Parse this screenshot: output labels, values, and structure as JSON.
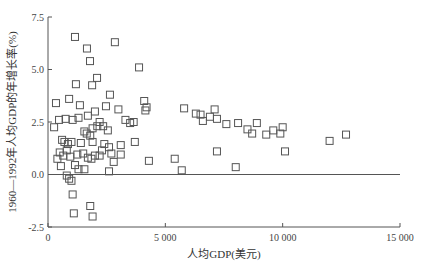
{
  "chart_data": {
    "type": "scatter",
    "title": "",
    "xlabel": "人均GDP(美元)",
    "ylabel": "1960—1992年人均GDP的年增长率(%)",
    "xlim": [
      0,
      15000
    ],
    "ylim": [
      -2.5,
      7.5
    ],
    "xticks": [
      0,
      5000,
      10000,
      15000
    ],
    "xtick_labels": [
      "0",
      "5 000",
      "10 000",
      "15 000"
    ],
    "yticks": [
      -2.5,
      0.0,
      2.5,
      5.0,
      7.5
    ],
    "ytick_labels": [
      "-2.5",
      "0.0",
      "2.5",
      "5.0",
      "7.5"
    ],
    "grid": false,
    "legend": null,
    "reference_line": {
      "y": 0.0
    },
    "marker": "open-square",
    "series": [
      {
        "name": "countries",
        "points": [
          [
            1150,
            6.55
          ],
          [
            1660,
            6.0
          ],
          [
            1790,
            5.4
          ],
          [
            2850,
            6.3
          ],
          [
            2090,
            4.6
          ],
          [
            1190,
            4.3
          ],
          [
            1880,
            4.25
          ],
          [
            2640,
            3.8
          ],
          [
            3880,
            5.1
          ],
          [
            340,
            3.4
          ],
          [
            900,
            3.6
          ],
          [
            1360,
            3.3
          ],
          [
            2470,
            3.25
          ],
          [
            470,
            2.6
          ],
          [
            260,
            2.25
          ],
          [
            3650,
            2.5
          ],
          [
            4100,
            3.5
          ],
          [
            4200,
            3.2
          ],
          [
            3000,
            3.1
          ],
          [
            2000,
            3.0
          ],
          [
            1300,
            2.7
          ],
          [
            1700,
            2.8
          ],
          [
            2200,
            2.5
          ],
          [
            2100,
            2.3
          ],
          [
            1900,
            2.2
          ],
          [
            1550,
            2.05
          ],
          [
            1650,
            1.95
          ],
          [
            1800,
            1.85
          ],
          [
            2350,
            2.3
          ],
          [
            2550,
            2.1
          ],
          [
            750,
            2.65
          ],
          [
            1050,
            2.6
          ],
          [
            3300,
            2.6
          ],
          [
            3500,
            2.45
          ],
          [
            4150,
            3.05
          ],
          [
            1000,
            1.55
          ],
          [
            1400,
            1.5
          ],
          [
            600,
            1.65
          ],
          [
            700,
            1.55
          ],
          [
            850,
            1.45
          ],
          [
            1900,
            1.55
          ],
          [
            2400,
            1.45
          ],
          [
            2600,
            1.3
          ],
          [
            3100,
            1.4
          ],
          [
            3700,
            1.55
          ],
          [
            500,
            1.05
          ],
          [
            650,
            0.9
          ],
          [
            800,
            1.15
          ],
          [
            950,
            0.85
          ],
          [
            1250,
            0.95
          ],
          [
            1500,
            1.0
          ],
          [
            2200,
            0.9
          ],
          [
            2700,
            1.0
          ],
          [
            3100,
            0.95
          ],
          [
            4300,
            0.65
          ],
          [
            1700,
            0.8
          ],
          [
            2000,
            0.9
          ],
          [
            2300,
            1.15
          ],
          [
            2800,
            0.6
          ],
          [
            1850,
            0.75
          ],
          [
            400,
            0.75
          ],
          [
            550,
            0.4
          ],
          [
            1150,
            0.45
          ],
          [
            1300,
            0.25
          ],
          [
            1550,
            0.25
          ],
          [
            2600,
            0.15
          ],
          [
            5400,
            0.75
          ],
          [
            5700,
            0.2
          ],
          [
            5800,
            3.15
          ],
          [
            6300,
            2.9
          ],
          [
            6500,
            2.85
          ],
          [
            6600,
            2.55
          ],
          [
            6900,
            2.75
          ],
          [
            7100,
            3.1
          ],
          [
            7200,
            2.65
          ],
          [
            7200,
            1.1
          ],
          [
            7600,
            2.4
          ],
          [
            8000,
            0.35
          ],
          [
            8100,
            2.45
          ],
          [
            8500,
            2.15
          ],
          [
            8700,
            1.95
          ],
          [
            8900,
            2.45
          ],
          [
            9300,
            1.9
          ],
          [
            9600,
            2.1
          ],
          [
            9900,
            1.95
          ],
          [
            10000,
            2.25
          ],
          [
            10100,
            1.1
          ],
          [
            12000,
            1.6
          ],
          [
            12700,
            1.9
          ],
          [
            800,
            -0.05
          ],
          [
            900,
            -0.2
          ],
          [
            1000,
            -0.3
          ],
          [
            1050,
            -0.95
          ],
          [
            1100,
            -1.85
          ],
          [
            1800,
            -1.5
          ],
          [
            1900,
            -2.0
          ]
        ]
      }
    ]
  }
}
